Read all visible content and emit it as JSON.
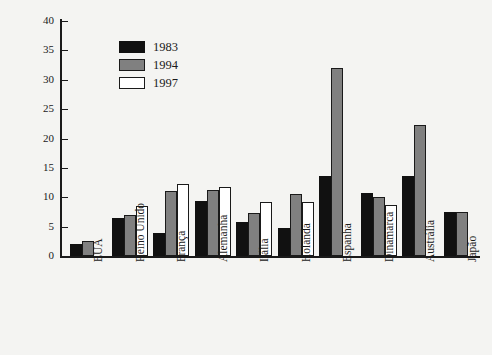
{
  "chart_data": {
    "type": "bar",
    "title": "",
    "xlabel": "",
    "ylabel": "Percentagem",
    "ylim": [
      0,
      40
    ],
    "yticks": [
      0,
      5,
      10,
      15,
      20,
      25,
      30,
      35,
      40
    ],
    "grid": false,
    "legend_position": "upper-left-inside",
    "categories": [
      "EUA",
      "Reino Unido",
      "França",
      "Alemanha",
      "Itália",
      "Holanda",
      "Espanha",
      "Dinamarca",
      "Austrália",
      "Japão"
    ],
    "series": [
      {
        "name": "1983",
        "color": "#111111",
        "values": [
          2.0,
          6.5,
          4.0,
          9.3,
          5.8,
          4.8,
          13.7,
          10.8,
          13.7,
          7.5
        ]
      },
      {
        "name": "1994",
        "color": "#808080",
        "values": [
          2.5,
          7.0,
          11.0,
          11.3,
          7.3,
          10.5,
          32.0,
          10.0,
          22.3,
          7.5
        ]
      },
      {
        "name": "1997",
        "color": "#ffffff",
        "values": [
          null,
          8.5,
          12.2,
          11.7,
          9.2,
          9.2,
          null,
          8.6,
          null,
          null
        ]
      }
    ]
  },
  "caption": {
    "text": ""
  }
}
